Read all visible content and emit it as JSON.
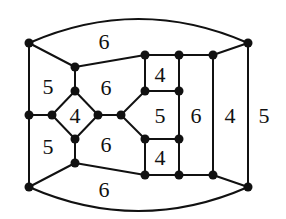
{
  "diagram": {
    "type": "planar-graph",
    "nodes": [
      {
        "id": "TL",
        "x": 29,
        "y": 43
      },
      {
        "id": "TR",
        "x": 248,
        "y": 43
      },
      {
        "id": "BL",
        "x": 29,
        "y": 187
      },
      {
        "id": "BR",
        "x": 248,
        "y": 187
      },
      {
        "id": "LM",
        "x": 29,
        "y": 115
      },
      {
        "id": "a1",
        "x": 75,
        "y": 67
      },
      {
        "id": "a2",
        "x": 75,
        "y": 91
      },
      {
        "id": "dL",
        "x": 52,
        "y": 115
      },
      {
        "id": "dR",
        "x": 98,
        "y": 115
      },
      {
        "id": "a3",
        "x": 75,
        "y": 139
      },
      {
        "id": "a4",
        "x": 75,
        "y": 163
      },
      {
        "id": "c0",
        "x": 121,
        "y": 115
      },
      {
        "id": "t1",
        "x": 145,
        "y": 55
      },
      {
        "id": "t2",
        "x": 179,
        "y": 55
      },
      {
        "id": "t3",
        "x": 213,
        "y": 55
      },
      {
        "id": "m1",
        "x": 145,
        "y": 91
      },
      {
        "id": "m2",
        "x": 179,
        "y": 91
      },
      {
        "id": "n1",
        "x": 145,
        "y": 139
      },
      {
        "id": "n2",
        "x": 179,
        "y": 139
      },
      {
        "id": "b1",
        "x": 145,
        "y": 175
      },
      {
        "id": "b2",
        "x": 179,
        "y": 175
      },
      {
        "id": "b3",
        "x": 213,
        "y": 175
      }
    ],
    "edges": [
      {
        "kind": "arc",
        "from": "TL",
        "to": "TR",
        "ctrl_y": -5
      },
      {
        "kind": "arc",
        "from": "BL",
        "to": "BR",
        "ctrl_y": 235
      },
      [
        "TL",
        "LM"
      ],
      [
        "LM",
        "BL"
      ],
      [
        "TL",
        "a1"
      ],
      [
        "BL",
        "a4"
      ],
      [
        "a1",
        "a2"
      ],
      [
        "a1",
        "t1"
      ],
      [
        "a4",
        "a3"
      ],
      [
        "a4",
        "b1"
      ],
      [
        "LM",
        "dL"
      ],
      [
        "dL",
        "a2"
      ],
      [
        "a2",
        "dR"
      ],
      [
        "dR",
        "a3"
      ],
      [
        "a3",
        "dL"
      ],
      [
        "dR",
        "c0"
      ],
      [
        "c0",
        "m1"
      ],
      [
        "c0",
        "n1"
      ],
      [
        "t1",
        "t2"
      ],
      [
        "t2",
        "t3"
      ],
      [
        "t3",
        "TR"
      ],
      [
        "t1",
        "m1"
      ],
      [
        "m1",
        "m2"
      ],
      [
        "t2",
        "m2"
      ],
      [
        "m2",
        "n2"
      ],
      [
        "n1",
        "n2"
      ],
      [
        "n1",
        "b1"
      ],
      [
        "n2",
        "b2"
      ],
      [
        "b1",
        "b2"
      ],
      [
        "b2",
        "b3"
      ],
      [
        "b3",
        "BR"
      ],
      [
        "t3",
        "b3"
      ],
      [
        "TR",
        "BR"
      ]
    ],
    "face_labels": [
      {
        "text": "6",
        "x": 104,
        "y": 41
      },
      {
        "text": "5",
        "x": 48,
        "y": 86
      },
      {
        "text": "6",
        "x": 106,
        "y": 87
      },
      {
        "text": "4",
        "x": 160,
        "y": 74
      },
      {
        "text": "4",
        "x": 75,
        "y": 115
      },
      {
        "text": "5",
        "x": 160,
        "y": 115
      },
      {
        "text": "6",
        "x": 196,
        "y": 115
      },
      {
        "text": "4",
        "x": 230,
        "y": 115
      },
      {
        "text": "5",
        "x": 264,
        "y": 115
      },
      {
        "text": "5",
        "x": 48,
        "y": 146
      },
      {
        "text": "6",
        "x": 106,
        "y": 144
      },
      {
        "text": "4",
        "x": 160,
        "y": 157
      },
      {
        "text": "6",
        "x": 104,
        "y": 189
      }
    ],
    "colors": {
      "ink": "#111111",
      "background": "#ffffff"
    }
  }
}
